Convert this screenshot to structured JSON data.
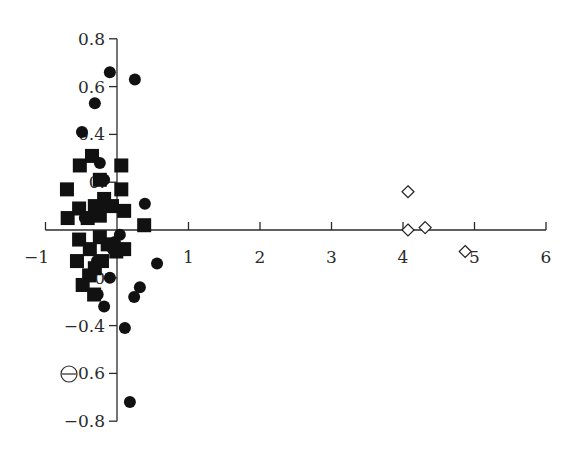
{
  "chart_data": {
    "type": "scatter",
    "title": "",
    "xlabel": "",
    "ylabel": "",
    "xlim": [
      -1,
      6
    ],
    "ylim": [
      -0.8,
      0.8
    ],
    "grid": false,
    "legend": null,
    "x_ticks": [
      -1,
      1,
      2,
      3,
      4,
      5,
      6
    ],
    "x_tick_labels": [
      "−1",
      "1",
      "2",
      "3",
      "4",
      "5",
      "6"
    ],
    "y_ticks": [
      0.8,
      0.6,
      0.4,
      0.2,
      -0.2,
      -0.4,
      -0.6,
      -0.8
    ],
    "y_tick_labels": [
      "0.8",
      "0.6",
      "0.4",
      "0.",
      "−0",
      "−0.4",
      "−0.6",
      "−0.8"
    ],
    "annotations": [
      {
        "type": "open-circle-marker",
        "x": -0.95,
        "y": -0.6
      }
    ],
    "series": [
      {
        "name": "filled squares",
        "marker": "square",
        "filled": true,
        "points": [
          [
            -0.35,
            0.31
          ],
          [
            -0.52,
            0.27
          ],
          [
            0.06,
            0.27
          ],
          [
            -0.7,
            0.17
          ],
          [
            -0.24,
            0.21
          ],
          [
            0.06,
            0.17
          ],
          [
            -0.69,
            0.05
          ],
          [
            -0.53,
            0.09
          ],
          [
            -0.31,
            0.1
          ],
          [
            -0.18,
            0.13
          ],
          [
            -0.07,
            0.1
          ],
          [
            0.1,
            0.08
          ],
          [
            -0.41,
            0.05
          ],
          [
            -0.24,
            0.06
          ],
          [
            0.38,
            0.02
          ],
          [
            -0.53,
            -0.04
          ],
          [
            -0.38,
            -0.08
          ],
          [
            -0.24,
            -0.03
          ],
          [
            -0.13,
            -0.06
          ],
          [
            -0.01,
            -0.09
          ],
          [
            -0.56,
            -0.13
          ],
          [
            -0.31,
            -0.16
          ],
          [
            -0.21,
            -0.13
          ],
          [
            -0.39,
            -0.19
          ],
          [
            -0.48,
            -0.23
          ],
          [
            -0.32,
            -0.27
          ],
          [
            0.1,
            -0.08
          ]
        ]
      },
      {
        "name": "filled circles",
        "marker": "circle",
        "filled": true,
        "points": [
          [
            -0.1,
            0.66
          ],
          [
            0.25,
            0.63
          ],
          [
            -0.31,
            0.53
          ],
          [
            -0.49,
            0.41
          ],
          [
            -0.24,
            0.28
          ],
          [
            -0.18,
            0.21
          ],
          [
            -0.15,
            0.1
          ],
          [
            0.39,
            0.11
          ],
          [
            -0.45,
            0.05
          ],
          [
            0.04,
            -0.02
          ],
          [
            -0.03,
            -0.05
          ],
          [
            -0.28,
            -0.13
          ],
          [
            -0.06,
            -0.08
          ],
          [
            0.56,
            -0.14
          ],
          [
            -0.1,
            -0.2
          ],
          [
            0.32,
            -0.24
          ],
          [
            0.24,
            -0.28
          ],
          [
            -0.27,
            -0.27
          ],
          [
            -0.18,
            -0.32
          ],
          [
            0.11,
            -0.41
          ],
          [
            0.18,
            -0.72
          ]
        ]
      },
      {
        "name": "open diamonds",
        "marker": "diamond",
        "filled": false,
        "points": [
          [
            4.07,
            0.16
          ],
          [
            4.07,
            0.0
          ],
          [
            4.31,
            0.01
          ],
          [
            4.87,
            -0.09
          ]
        ]
      }
    ]
  },
  "colors": {
    "axis": "#2a2a2a",
    "marker": "#111111",
    "background": "#ffffff"
  }
}
